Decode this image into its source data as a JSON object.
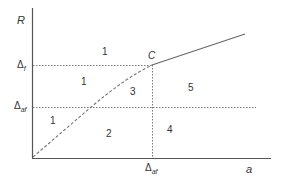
{
  "diagram": {
    "axes": {
      "y_label": "R",
      "x_label": "a"
    },
    "y_ticks": [
      {
        "symbol": "Δ",
        "subscript": "f"
      },
      {
        "symbol": "Δ",
        "subscript": "af"
      }
    ],
    "x_ticks": [
      {
        "symbol": "Δ",
        "subscript": "af"
      }
    ],
    "point_label": "C",
    "regions": [
      {
        "id": "r1_top",
        "label": "1"
      },
      {
        "id": "r1_mid",
        "label": "1"
      },
      {
        "id": "r1_low",
        "label": "1"
      },
      {
        "id": "r2",
        "label": "2"
      },
      {
        "id": "r3",
        "label": "3"
      },
      {
        "id": "r4",
        "label": "4"
      },
      {
        "id": "r5",
        "label": "5"
      }
    ],
    "colors": {
      "axis": "#555555",
      "line": "#666666",
      "dotted": "#777777",
      "text": "#333333"
    }
  }
}
